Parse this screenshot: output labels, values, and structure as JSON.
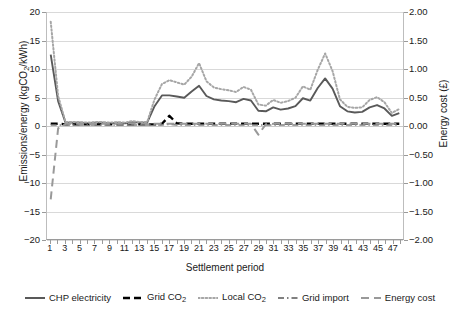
{
  "chart_data": {
    "type": "line",
    "title": "",
    "xlabel": "Settlement period",
    "ylabel": "Emissions/energy (kgCO2/kWh)",
    "ylabel_secondary": "Energy cost (£)",
    "ylim": [
      -20,
      20
    ],
    "ylim_secondary": [
      -2.0,
      2.0
    ],
    "xlim": [
      1,
      48
    ],
    "grid": true,
    "legend_position": "bottom",
    "yticks": [
      -20,
      -15,
      -10,
      -5,
      0,
      5,
      10,
      15,
      20
    ],
    "ytick_labels": [
      "-20",
      "-15",
      "-10",
      "-5",
      "0",
      "5",
      "10",
      "15",
      "20"
    ],
    "yticks_secondary": [
      -2.0,
      -1.5,
      -1.0,
      -0.5,
      0.0,
      0.5,
      1.0,
      1.5,
      2.0
    ],
    "ytick_labels_secondary": [
      "-2.00",
      "-1.50",
      "-1.00",
      "-0.50",
      "0.00",
      "0.50",
      "1.00",
      "1.50",
      "2.00"
    ],
    "x": [
      1,
      2,
      3,
      4,
      5,
      6,
      7,
      8,
      9,
      10,
      11,
      12,
      13,
      14,
      15,
      16,
      17,
      18,
      19,
      20,
      21,
      22,
      23,
      24,
      25,
      26,
      27,
      28,
      29,
      30,
      31,
      32,
      33,
      34,
      35,
      36,
      37,
      38,
      39,
      40,
      41,
      42,
      43,
      44,
      45,
      46,
      47,
      48
    ],
    "xtick_labels": [
      "1",
      "3",
      "5",
      "7",
      "9",
      "11",
      "13",
      "15",
      "17",
      "19",
      "21",
      "23",
      "25",
      "27",
      "29",
      "31",
      "33",
      "35",
      "37",
      "39",
      "41",
      "43",
      "45",
      "47"
    ],
    "series": [
      {
        "name": "CHP electricity",
        "axis": "left",
        "color": "#595959",
        "style": "solid",
        "width": 1.9,
        "values": [
          12.5,
          4.3,
          0.5,
          0.5,
          0.5,
          0.4,
          0.5,
          0.5,
          0.4,
          0.5,
          0.4,
          0.6,
          0.5,
          0.5,
          3.4,
          5.3,
          5.3,
          5.1,
          4.9,
          6.0,
          7.0,
          5.2,
          4.6,
          4.4,
          4.3,
          4.1,
          4.7,
          4.4,
          2.6,
          2.5,
          3.2,
          2.8,
          3.0,
          3.4,
          4.8,
          4.4,
          6.6,
          8.3,
          6.5,
          3.4,
          2.5,
          2.3,
          2.4,
          3.2,
          3.6,
          3.0,
          1.7,
          2.2
        ]
      },
      {
        "name": "Grid CO2",
        "axis": "left",
        "color": "#000000",
        "style": "dashed",
        "width": 2.4,
        "values": [
          0.3,
          0.3,
          0.2,
          0.2,
          0.2,
          0.2,
          0.2,
          0.2,
          0.2,
          0.2,
          0.2,
          0.2,
          0.2,
          0.2,
          0.2,
          0.3,
          1.7,
          0.4,
          0.3,
          0.3,
          0.3,
          0.3,
          0.3,
          0.3,
          0.3,
          0.3,
          0.3,
          0.3,
          0.3,
          0.3,
          0.3,
          0.3,
          0.3,
          0.3,
          0.3,
          0.3,
          0.3,
          0.3,
          0.3,
          0.3,
          0.3,
          0.3,
          0.3,
          0.3,
          0.3,
          0.3,
          0.3,
          0.3
        ]
      },
      {
        "name": "Local CO2",
        "axis": "left",
        "color": "#a6a6a6",
        "style": "dotted",
        "width": 2.0,
        "values": [
          18.3,
          5.2,
          0.6,
          0.6,
          0.6,
          0.5,
          0.6,
          0.6,
          0.5,
          0.6,
          0.5,
          0.8,
          0.6,
          0.6,
          4.6,
          7.3,
          8.0,
          7.6,
          7.2,
          8.6,
          11.0,
          7.8,
          6.7,
          6.4,
          6.2,
          5.9,
          6.8,
          6.3,
          3.7,
          3.5,
          4.5,
          4.0,
          4.3,
          4.9,
          6.9,
          6.3,
          9.8,
          12.7,
          9.6,
          4.6,
          3.3,
          3.1,
          3.2,
          4.5,
          5.0,
          4.1,
          2.2,
          2.9
        ]
      },
      {
        "name": "Grid import",
        "axis": "left",
        "color": "#808080",
        "style": "dashdot",
        "width": 1.6,
        "values": [
          0.1,
          0.1,
          0.1,
          0.1,
          0.1,
          0.1,
          0.1,
          0.1,
          0.1,
          0.1,
          0.1,
          0.1,
          0.1,
          0.1,
          0.1,
          0.1,
          0.2,
          0.1,
          0.1,
          0.1,
          0.1,
          0.1,
          0.1,
          0.1,
          0.1,
          0.1,
          0.1,
          0.1,
          0.1,
          0.1,
          0.1,
          0.1,
          0.1,
          0.1,
          0.1,
          0.1,
          0.1,
          0.1,
          0.1,
          0.1,
          0.1,
          0.1,
          0.1,
          0.1,
          0.1,
          0.1,
          0.1,
          0.1
        ]
      },
      {
        "name": "Energy cost",
        "axis": "right",
        "color": "#999999",
        "style": "longdash",
        "width": 2.0,
        "values": [
          -1.3,
          -0.05,
          0.03,
          0.03,
          0.03,
          0.03,
          0.03,
          0.03,
          0.03,
          0.03,
          0.03,
          0.04,
          0.03,
          0.03,
          0.03,
          0.03,
          0.03,
          0.03,
          0.03,
          0.03,
          0.03,
          0.03,
          0.03,
          0.03,
          0.03,
          0.03,
          0.03,
          0.03,
          -0.16,
          0.02,
          0.03,
          0.03,
          0.03,
          0.03,
          0.03,
          0.03,
          0.03,
          0.03,
          0.03,
          0.03,
          0.03,
          0.03,
          0.03,
          0.03,
          0.03,
          0.03,
          0.03,
          0.03
        ]
      }
    ]
  },
  "legend": {
    "items": [
      {
        "label": "CHP electricity"
      },
      {
        "label": "Grid CO",
        "sub": "2"
      },
      {
        "label": "Local CO",
        "sub": "2"
      },
      {
        "label": "Grid import"
      },
      {
        "label": "Energy cost"
      }
    ]
  },
  "axis_titles": {
    "left_pre": "Emissions/energy (kgCO",
    "left_sub": "2",
    "left_post": "/kWh)",
    "right": "Energy cost (£)",
    "bottom": "Settlement period"
  }
}
